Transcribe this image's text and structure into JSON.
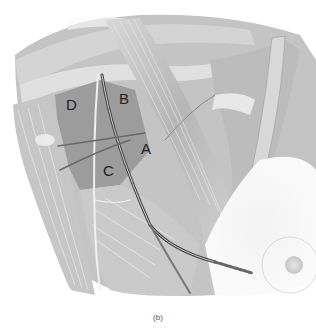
{
  "figure": {
    "labels": [
      {
        "id": "A",
        "text": "A",
        "x": 141,
        "y": 141
      },
      {
        "id": "B",
        "text": "B",
        "x": 119,
        "y": 91
      },
      {
        "id": "C",
        "text": "C",
        "x": 103,
        "y": 163
      },
      {
        "id": "D",
        "text": "D",
        "x": 66,
        "y": 97
      }
    ],
    "caption": "(b)"
  },
  "colors": {
    "background": "#ffffff",
    "muscle_dark": "#9a9a9a",
    "muscle_mid": "#bdbdbd",
    "muscle_light": "#dcdcdc",
    "line": "#555555"
  }
}
